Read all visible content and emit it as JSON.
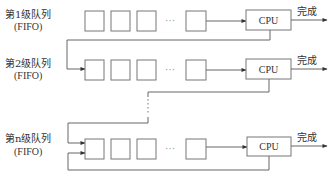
{
  "diagram": {
    "title": "",
    "colors": {
      "stroke": "#666666",
      "box_stroke": "#777777",
      "text": "#333333",
      "background": "#ffffff"
    },
    "levels": [
      {
        "label": "第1级队列",
        "sublabel": "(FIFO)",
        "queue_slots": 4,
        "ellipsis": "···",
        "processor": "CPU",
        "output": "完成"
      },
      {
        "label": "第2级队列",
        "sublabel": "(FIFO)",
        "queue_slots": 4,
        "ellipsis": "···",
        "processor": "CPU",
        "output": "完成"
      },
      {
        "label": "第n级队列",
        "sublabel": "(FIFO)",
        "queue_slots": 4,
        "ellipsis": "···",
        "processor": "CPU",
        "output": "完成"
      }
    ],
    "between_levels_ellipsis": "⋮"
  }
}
